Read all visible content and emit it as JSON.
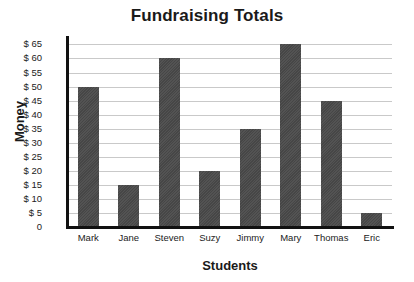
{
  "chart_data": {
    "type": "bar",
    "title": "Fundraising Totals",
    "xlabel": "Students",
    "ylabel": "Money",
    "categories": [
      "Mark",
      "Jane",
      "Steven",
      "Suzy",
      "Jimmy",
      "Mary",
      "Thomas",
      "Eric"
    ],
    "values": [
      50,
      15,
      60,
      20,
      35,
      65,
      45,
      5
    ],
    "ytick_labels": [
      "$ 65",
      "$ 60",
      "$ 55",
      "$ 50",
      "$ 45",
      "$ 40",
      "$ 35",
      "$ 30",
      "$ 25",
      "$ 20",
      "$ 15",
      "$ 10",
      "$ 5",
      "0"
    ],
    "ytick_values": [
      65,
      60,
      55,
      50,
      45,
      40,
      35,
      30,
      25,
      20,
      15,
      10,
      5,
      0
    ],
    "ylim": [
      0,
      68
    ],
    "grid": true,
    "legend": "none",
    "bar_color": "#4a4a4a",
    "grid_color": "#c9c9c9",
    "axis_color": "#111111"
  }
}
